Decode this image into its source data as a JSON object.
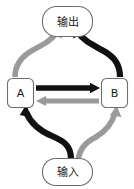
{
  "diagram": {
    "type": "flow-cycle-diagram",
    "canvas": {
      "width": 134,
      "height": 189,
      "background": "#ffffff"
    },
    "colors": {
      "black_path": "#111111",
      "gray_path": "#9a9a9a",
      "node_stroke": "#6e6e6e",
      "node_fill": "#ffffff",
      "label_text": "#1a1a1a"
    },
    "nodes": [
      {
        "id": "output",
        "label": "输出",
        "shape": "rounded-pill",
        "x": 42,
        "y": 6,
        "w": 51,
        "h": 31
      },
      {
        "id": "a",
        "label": "A",
        "shape": "rounded-rect",
        "x": 7,
        "y": 78,
        "w": 27,
        "h": 30
      },
      {
        "id": "b",
        "label": "B",
        "shape": "rounded-rect",
        "x": 101,
        "y": 78,
        "w": 27,
        "h": 30
      },
      {
        "id": "input",
        "label": "输入",
        "shape": "rounded-pill",
        "x": 42,
        "y": 158,
        "w": 51,
        "h": 28
      }
    ],
    "edges": [
      {
        "id": "a-to-b",
        "from": "a",
        "to": "b",
        "color": "black",
        "style": "straight-thick",
        "label": ""
      },
      {
        "id": "b-to-a",
        "from": "b",
        "to": "a",
        "color": "gray",
        "style": "straight-thick",
        "label": ""
      },
      {
        "id": "a-to-output",
        "from": "a",
        "to": "output",
        "color": "gray",
        "style": "curved-thick",
        "label": ""
      },
      {
        "id": "b-to-output",
        "from": "b",
        "to": "output",
        "color": "black",
        "style": "curved-thick",
        "label": ""
      },
      {
        "id": "input-to-a",
        "from": "input",
        "to": "a",
        "color": "black",
        "style": "curved-thick",
        "label": ""
      },
      {
        "id": "input-to-b",
        "from": "input",
        "to": "b",
        "color": "gray",
        "style": "curved-thick",
        "label": ""
      }
    ]
  }
}
